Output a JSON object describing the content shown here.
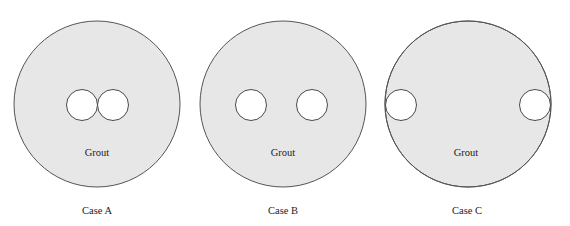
{
  "figure": {
    "colors": {
      "grout_fill": "#e7e7e7",
      "outline": "#555555",
      "hole_fill": "#ffffff",
      "text": "#222222"
    },
    "cases": [
      {
        "caption": "Case A",
        "material_label": "Grout",
        "description": "Two holes touching at center",
        "outer": {
          "cx": 97,
          "cy": 104,
          "r": 83
        },
        "holes": [
          {
            "cx": 82,
            "cy": 105,
            "r": 15.5
          },
          {
            "cx": 113,
            "cy": 105,
            "r": 15.5
          }
        ]
      },
      {
        "caption": "Case B",
        "material_label": "Grout",
        "description": "Two holes separated",
        "outer": {
          "cx": 283,
          "cy": 104,
          "r": 83
        },
        "holes": [
          {
            "cx": 251,
            "cy": 105,
            "r": 15.5
          },
          {
            "cx": 312,
            "cy": 105,
            "r": 15.5
          }
        ]
      },
      {
        "caption": "Case C",
        "material_label": "Grout",
        "description": "Two holes at outer edge",
        "outer": {
          "cx": 468,
          "cy": 104,
          "r": 83
        },
        "holes": [
          {
            "cx": 401,
            "cy": 105,
            "r": 15.5
          },
          {
            "cx": 535,
            "cy": 105,
            "r": 15.5
          }
        ]
      }
    ]
  }
}
